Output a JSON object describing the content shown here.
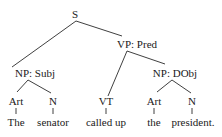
{
  "tree": {
    "root": "S",
    "nodes": {
      "s": "S",
      "vp": "VP: Pred",
      "np_subj": "NP: Subj",
      "art1": "Art",
      "n1": "N",
      "vt": "VT",
      "np_dobj": "NP: DObj",
      "art2": "Art",
      "n2": "N"
    },
    "words": {
      "w1": "The",
      "w2": "senator",
      "w3": "called up",
      "w4": "the",
      "w5": "president."
    },
    "edges": [
      [
        "S",
        "NP: Subj"
      ],
      [
        "S",
        "VP: Pred"
      ],
      [
        "NP: Subj",
        "Art"
      ],
      [
        "NP: Subj",
        "N"
      ],
      [
        "VP: Pred",
        "VT"
      ],
      [
        "VP: Pred",
        "NP: DObj"
      ],
      [
        "NP: DObj",
        "Art"
      ],
      [
        "NP: DObj",
        "N"
      ],
      [
        "Art",
        "The"
      ],
      [
        "N",
        "senator"
      ],
      [
        "VT",
        "called up"
      ],
      [
        "Art",
        "the"
      ],
      [
        "N",
        "president."
      ]
    ]
  }
}
